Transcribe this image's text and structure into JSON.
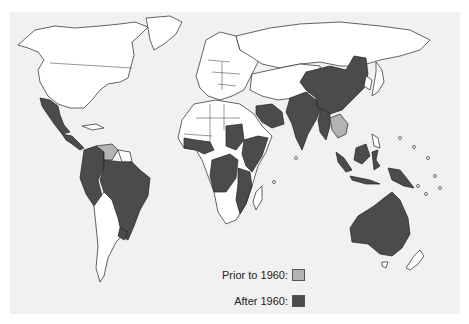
{
  "map": {
    "type": "world choropleth",
    "background": "#f1f1f1",
    "categories": [
      {
        "key": "prior",
        "color": "#b3b3b3"
      },
      {
        "key": "after",
        "color": "#4b4b4b"
      }
    ],
    "prior_to_1960_regions": [
      "Venezuela",
      "Thailand"
    ],
    "after_1960_regions": [
      "Mexico",
      "Central America",
      "Colombia",
      "Ecuador",
      "Peru",
      "Brazil",
      "Uruguay",
      "West Africa coast",
      "Sudan",
      "Ethiopia",
      "Somalia",
      "Kenya",
      "Tanzania",
      "Congo",
      "Angola",
      "Zambia",
      "Mozambique",
      "Saudi Arabia",
      "Pakistan",
      "India",
      "China",
      "Myanmar",
      "Indonesia",
      "Malaysia",
      "Papua New Guinea",
      "Australia"
    ]
  },
  "legend": {
    "prior_label": "Prior to 1960:",
    "after_label": "After 1960:"
  }
}
